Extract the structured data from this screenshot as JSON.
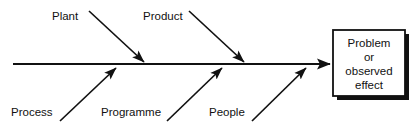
{
  "diagram": {
    "type": "fishbone-ishikawa",
    "title": "",
    "colors": {
      "line": "#111111",
      "text": "#111111",
      "background": "#ffffff",
      "shadow": "#111111",
      "box_fill": "#ffffff"
    },
    "spine": {
      "label": "main-spine-arrow",
      "x1": 13,
      "y1": 64,
      "x2": 332,
      "y2": 64,
      "arrowhead": "right"
    },
    "top_branches": [
      {
        "label": "Plant",
        "label_x": 52,
        "label_y": 20,
        "line": {
          "x1": 89,
          "y1": 11,
          "x2": 145,
          "y2": 63
        }
      },
      {
        "label": "Product",
        "label_x": 143,
        "label_y": 20,
        "line": {
          "x1": 189,
          "y1": 11,
          "x2": 245,
          "y2": 63
        }
      }
    ],
    "bottom_branches": [
      {
        "label": "Process",
        "label_x": 11,
        "label_y": 116,
        "line": {
          "x1": 60,
          "y1": 121,
          "x2": 117,
          "y2": 67
        }
      },
      {
        "label": "Programme",
        "label_x": 101,
        "label_y": 116,
        "line": {
          "x1": 167,
          "y1": 121,
          "x2": 223,
          "y2": 67
        }
      },
      {
        "label": "People",
        "label_x": 209,
        "label_y": 116,
        "line": {
          "x1": 252,
          "y1": 121,
          "x2": 307,
          "y2": 67
        }
      }
    ],
    "effect_box": {
      "name": "problem-or-observed-effect-box",
      "x": 333,
      "y": 30,
      "width": 72,
      "height": 66,
      "shadow_offset": 4,
      "lines": [
        "Problem",
        "or",
        "observed",
        "effect"
      ],
      "line_y": [
        47,
        61,
        75,
        89
      ],
      "center_x": 369
    }
  }
}
